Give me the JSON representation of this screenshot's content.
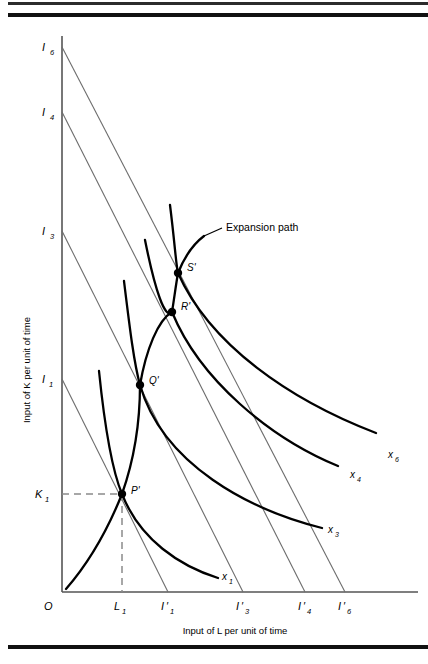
{
  "figure": {
    "axes": {
      "y_title": "Input of K per unit of time",
      "x_title": "Input of L per unit of time",
      "origin_label": "O"
    },
    "y_ticks": [
      {
        "base": "I",
        "sub": "6",
        "y": 47
      },
      {
        "base": "I",
        "sub": "4",
        "y": 112
      },
      {
        "base": "I",
        "sub": "3",
        "y": 231
      },
      {
        "base": "I",
        "sub": "1",
        "y": 379
      },
      {
        "base": "K",
        "sub": "1",
        "y": 494
      }
    ],
    "x_ticks": [
      {
        "base": "L",
        "sub": "1",
        "prime": false,
        "x": 122
      },
      {
        "base": "I",
        "sub": "1",
        "prime": true,
        "x": 168
      },
      {
        "base": "I",
        "sub": "3",
        "prime": true,
        "x": 243
      },
      {
        "base": "I",
        "sub": "4",
        "prime": true,
        "x": 305
      },
      {
        "base": "I",
        "sub": "6",
        "prime": true,
        "x": 345
      }
    ],
    "isoquants": [
      {
        "base": "x",
        "sub": "1"
      },
      {
        "base": "x",
        "sub": "3"
      },
      {
        "base": "x",
        "sub": "4"
      },
      {
        "base": "x",
        "sub": "6"
      }
    ],
    "tangency_points": [
      {
        "label": "P'"
      },
      {
        "label": "Q'"
      },
      {
        "label": "R'"
      },
      {
        "label": "S'"
      }
    ],
    "annotation": "Expansion path",
    "colors": {
      "axis": "#555555",
      "isocost": "#6d6d6d",
      "isoquant": "#000000",
      "expansion_path": "#000000",
      "dashed": "#8a8a8a",
      "rule": "#111111"
    }
  }
}
